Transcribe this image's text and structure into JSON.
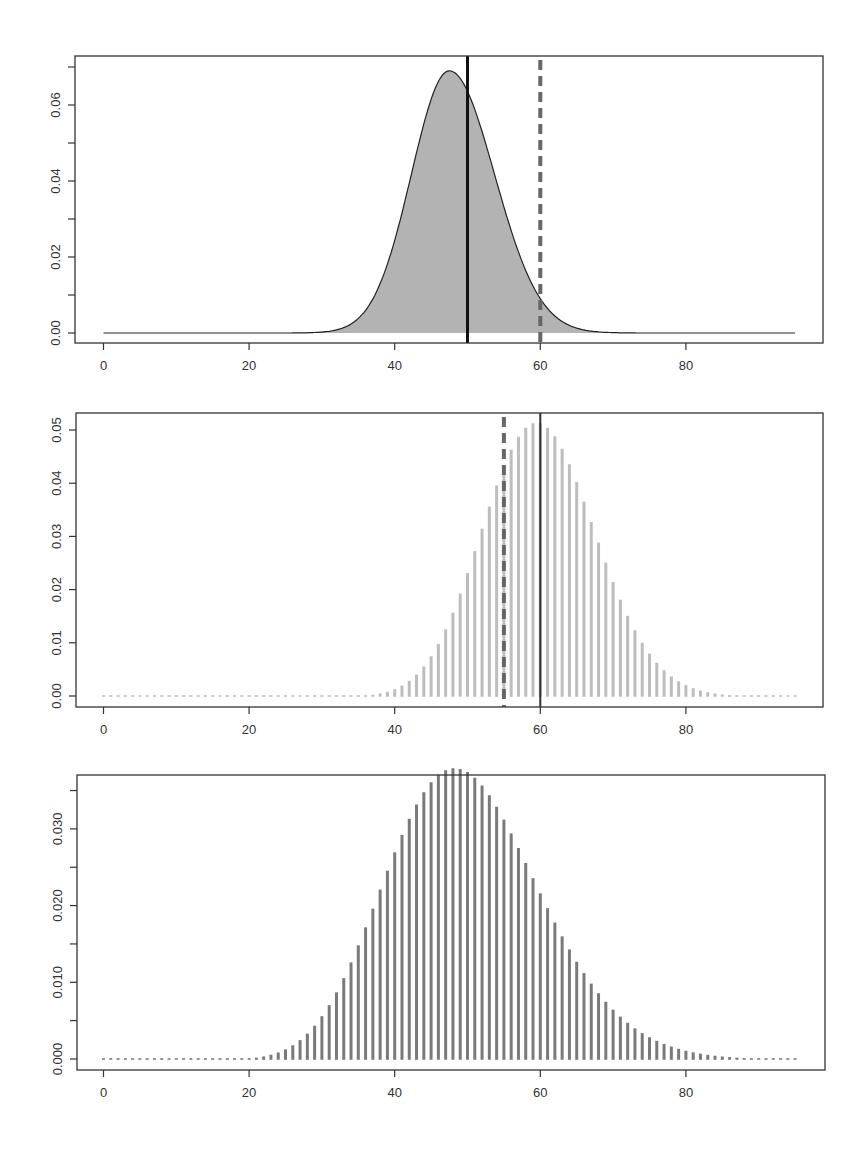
{
  "chart_data": [
    {
      "type": "area",
      "title": "",
      "xlabel": "",
      "ylabel": "",
      "xlim": [
        -4,
        99
      ],
      "ylim": [
        0,
        0.072
      ],
      "x_ticks": [
        0,
        20,
        40,
        60,
        80
      ],
      "x_tick_labels": [
        "0",
        "20",
        "40",
        "60",
        "80"
      ],
      "y_ticks": [
        0,
        0.01,
        0.02,
        0.03,
        0.04,
        0.05,
        0.06,
        0.07
      ],
      "y_tick_labels": [
        "0.00",
        "",
        "0.02",
        "",
        "0.04",
        "",
        "0.06",
        ""
      ],
      "grid": false,
      "series": [
        {
          "name": "density",
          "kind": "filled-curve",
          "fill": "#b3b3b3",
          "stroke": "#222222",
          "mode": 47.5,
          "peak": 0.069,
          "sd_left": 5.2,
          "sd_right": 6.2,
          "x_range": [
            0,
            95
          ]
        }
      ],
      "reference_lines": [
        {
          "x": 50,
          "style": "solid",
          "color": "#111111",
          "width": 3
        },
        {
          "x": 60,
          "style": "dashed",
          "color": "#666666",
          "width": 4
        }
      ]
    },
    {
      "type": "bar",
      "subtype": "spike",
      "title": "",
      "xlabel": "",
      "ylabel": "",
      "xlim": [
        -4,
        99
      ],
      "ylim": [
        0,
        0.052
      ],
      "x_ticks": [
        0,
        20,
        40,
        60,
        80
      ],
      "x_tick_labels": [
        "0",
        "20",
        "40",
        "60",
        "80"
      ],
      "y_ticks": [
        0,
        0.01,
        0.02,
        0.03,
        0.04,
        0.05
      ],
      "y_tick_labels": [
        "0.00",
        "0.01",
        "0.02",
        "0.03",
        "0.04",
        "0.05"
      ],
      "grid": false,
      "series": [
        {
          "name": "pmf",
          "color": "#bdbdbd",
          "distribution": "poisson",
          "lambda": 60,
          "x_range": [
            0,
            95
          ]
        }
      ],
      "reference_lines": [
        {
          "x": 60,
          "style": "solid",
          "color": "#333333",
          "width": 2
        },
        {
          "x": 55,
          "style": "dashed",
          "color": "#666666",
          "width": 4
        }
      ]
    },
    {
      "type": "bar",
      "subtype": "spike",
      "title": "",
      "xlabel": "",
      "ylabel": "",
      "xlim": [
        -4,
        99
      ],
      "ylim": [
        0,
        0.036
      ],
      "x_ticks": [
        0,
        20,
        40,
        60,
        80
      ],
      "x_tick_labels": [
        "0",
        "20",
        "40",
        "60",
        "80"
      ],
      "y_ticks": [
        0,
        0.005,
        0.01,
        0.015,
        0.02,
        0.025,
        0.03,
        0.035
      ],
      "y_tick_labels": [
        "0.000",
        "",
        "0.010",
        "",
        "0.020",
        "",
        "0.030",
        ""
      ],
      "grid": false,
      "series": [
        {
          "name": "pmf",
          "color": "#7a7a7a",
          "distribution": "negative-binomial",
          "mean": 50,
          "size": 40,
          "x_range": [
            0,
            95
          ]
        }
      ],
      "reference_lines": []
    }
  ],
  "panels": [
    {
      "box": {
        "x": 75,
        "y": 56,
        "w": 748,
        "h": 287
      },
      "y_zero_px": 333,
      "y_px_per_unit": 3800
    },
    {
      "box": {
        "x": 76,
        "y": 413,
        "w": 747,
        "h": 294
      },
      "y_zero_px": 696,
      "y_px_per_unit": 5320
    },
    {
      "box": {
        "x": 77,
        "y": 775,
        "w": 748,
        "h": 295
      },
      "y_zero_px": 1059,
      "y_px_per_unit": 7670
    }
  ],
  "x_mapping": {
    "px_at_0": 103.5,
    "px_per_unit": 7.28
  }
}
